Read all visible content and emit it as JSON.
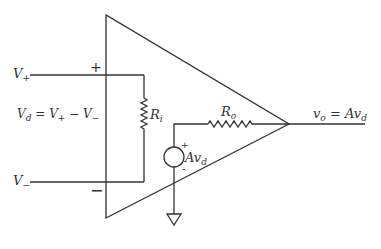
{
  "diagram": {
    "labels": {
      "v_plus": {
        "main": "V",
        "sub": "+"
      },
      "v_minus": {
        "main": "V",
        "sub": "−"
      },
      "v_d_equation": {
        "lhs_main": "V",
        "lhs_sub": "d",
        "eq": " = ",
        "t1_main": "V",
        "t1_sub": "+",
        "minus": " − ",
        "t2_main": "V",
        "t2_sub": "−"
      },
      "r_i": {
        "main": "R",
        "sub": "i"
      },
      "r_o": {
        "main": "R",
        "sub": "o"
      },
      "source": {
        "main": "Av",
        "sub": "d"
      },
      "output": {
        "lhs_main": "v",
        "lhs_sub": "o",
        "eq": " = ",
        "rhs_main": "Av",
        "rhs_sub": "d"
      },
      "plus_input_sign": "+",
      "minus_input_sign": "−",
      "source_plus_sign": "+",
      "source_minus_sign": "-"
    },
    "components": [
      {
        "type": "op-amp-triangle"
      },
      {
        "type": "resistor",
        "name": "R_i"
      },
      {
        "type": "resistor",
        "name": "R_o"
      },
      {
        "type": "dependent-voltage-source",
        "value": "Av_d"
      },
      {
        "type": "ground"
      }
    ],
    "colors": {
      "stroke": "#333333",
      "background": "#ffffff"
    }
  }
}
